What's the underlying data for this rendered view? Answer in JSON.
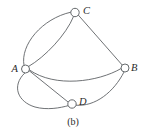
{
  "figure": {
    "caption": "(b)",
    "kind": "multigraph-diagram",
    "background_color": "#ffffff",
    "stroke_color": "#55595c",
    "label_color": "#2b2b2b"
  },
  "nodes": [
    {
      "id": "A",
      "label": "A",
      "cx": 25.5,
      "cy": 69.0,
      "r": 4.0,
      "label_x": 11.5,
      "label_y": 63.5
    },
    {
      "id": "B",
      "label": "B",
      "cx": 125.0,
      "cy": 68.0,
      "r": 4.0,
      "label_x": 131.0,
      "label_y": 63.0
    },
    {
      "id": "C",
      "label": "C",
      "cx": 75.0,
      "cy": 12.5,
      "r": 4.2,
      "label_x": 83.0,
      "label_y": 6.0
    },
    {
      "id": "D",
      "label": "D",
      "cx": 72.0,
      "cy": 104.0,
      "r": 4.2,
      "label_x": 79.0,
      "label_y": 96.5
    }
  ],
  "edges": [
    {
      "id": "edge-a-c-outer",
      "from": "A",
      "to": "C",
      "style": "curve-left",
      "d": "M 24.0 65.2 C 20.0 45.0 42.0 18.5 70.8 12.2"
    },
    {
      "id": "edge-a-c-inner",
      "from": "A",
      "to": "C",
      "style": "curve-right",
      "d": "M 28.5 66.5 C 45.0 57.0 66.0 35.0 73.5 16.6"
    },
    {
      "id": "edge-c-b",
      "from": "C",
      "to": "B",
      "style": "straight",
      "d": "M 78.4 15.2 L 122.0 64.8"
    },
    {
      "id": "edge-a-b",
      "from": "A",
      "to": "B",
      "style": "curve-down",
      "d": "M 29.5 70.0 C 55.0 88.0 98.0 82.0 121.0 68.6"
    },
    {
      "id": "edge-a-d-upper",
      "from": "A",
      "to": "D",
      "style": "straight",
      "d": "M 29.3 70.8 L 68.3 102.2"
    },
    {
      "id": "edge-a-d-lower",
      "from": "A",
      "to": "D",
      "style": "curve-down-left",
      "d": "M 24.8 73.0 C 11.0 86.0 18.0 102.0 35.0 107.0 C 47.0 110.3 60.0 108.0 68.4 105.6"
    },
    {
      "id": "edge-d-b",
      "from": "D",
      "to": "B",
      "style": "curve-right",
      "d": "M 76.0 105.2 C 95.0 107.0 114.0 92.0 124.0 72.0"
    }
  ],
  "icons": {
    "node_shape": "circle-node-icon"
  }
}
